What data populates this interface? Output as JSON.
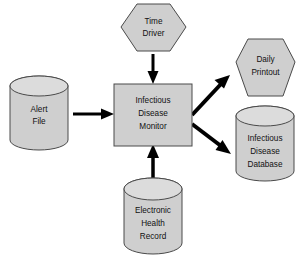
{
  "diagram": {
    "background_color": "#ffffff",
    "node_fill_color": "#cfcfcf",
    "node_stroke_color": "#4a4a4a",
    "edge_color": "#000000",
    "nodes": {
      "time_driver": {
        "shape": "hexagon",
        "lines": [
          "Time",
          "Driver"
        ],
        "line1": "Time",
        "line2": "Driver"
      },
      "alert_file": {
        "shape": "cylinder",
        "lines": [
          "Alert",
          "File"
        ],
        "line1": "Alert",
        "line2": "File"
      },
      "infectious_disease_monitor": {
        "shape": "rectangle",
        "lines": [
          "Infectious",
          "Disease",
          "Monitor"
        ],
        "line1": "Infectious",
        "line2": "Disease",
        "line3": "Monitor"
      },
      "electronic_health_record": {
        "shape": "cylinder",
        "lines": [
          "Electronic",
          "Health",
          "Record"
        ],
        "line1": "Electronic",
        "line2": "Health",
        "line3": "Record"
      },
      "daily_printout": {
        "shape": "hexagon",
        "lines": [
          "Daily",
          "Printout"
        ],
        "line1": "Daily",
        "line2": "Printout"
      },
      "infectious_disease_database": {
        "shape": "cylinder",
        "lines": [
          "Infectious",
          "Disease",
          "Database"
        ],
        "line1": "Infectious",
        "line2": "Disease",
        "line3": "Database"
      }
    },
    "edges": [
      {
        "id": "time-driver-to-monitor",
        "from": "time_driver",
        "to": "infectious_disease_monitor",
        "direction": "down"
      },
      {
        "id": "alert-file-to-monitor",
        "from": "alert_file",
        "to": "infectious_disease_monitor",
        "direction": "right"
      },
      {
        "id": "ehr-to-monitor",
        "from": "electronic_health_record",
        "to": "infectious_disease_monitor",
        "direction": "up"
      },
      {
        "id": "monitor-to-daily-printout",
        "from": "infectious_disease_monitor",
        "to": "daily_printout",
        "direction": "up-right"
      },
      {
        "id": "monitor-to-database",
        "from": "infectious_disease_monitor",
        "to": "infectious_disease_database",
        "direction": "down-right"
      }
    ]
  }
}
